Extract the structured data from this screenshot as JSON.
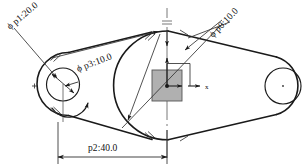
{
  "drawing": {
    "title": "mechanical-linkage-dimensioned-drawing",
    "canvas": {
      "width": 306,
      "height": 168,
      "background": "#ffffff"
    },
    "stroke_color": "#1a1a1a",
    "accent_fill": "#9a9a9a",
    "dimensions": [
      {
        "id": "p1",
        "label": "ϕ p1:20.0",
        "parameter": "p1",
        "value": "20.0",
        "symbol": "ϕ",
        "placement": "upper-left",
        "rotation": -40
      },
      {
        "id": "p3",
        "label": "ϕ p3:10.0",
        "parameter": "p3",
        "value": "10.0",
        "symbol": "ϕ",
        "placement": "upper-middle-left",
        "rotation": -21
      },
      {
        "id": "p0",
        "label": "ϕ p0:10.0",
        "parameter": "p0",
        "value": "10.0",
        "symbol": "ϕ",
        "placement": "upper-right",
        "rotation": -46
      },
      {
        "id": "p2",
        "label": "p2:40.0",
        "parameter": "p2",
        "value": "40.0",
        "symbol": "",
        "placement": "bottom-linear",
        "rotation": 0
      }
    ],
    "axes": {
      "x_label": "x",
      "y_label": "",
      "origin_marker": "origin-point"
    },
    "features": [
      {
        "name": "left-boss-circle",
        "type": "circle"
      },
      {
        "name": "left-boss-arc",
        "type": "arc"
      },
      {
        "name": "center-boss-arc",
        "type": "arc"
      },
      {
        "name": "right-boss-circle",
        "type": "circle"
      },
      {
        "name": "sketch-plane-square",
        "type": "rect"
      },
      {
        "name": "vertical-centerline",
        "type": "centerline"
      }
    ]
  }
}
